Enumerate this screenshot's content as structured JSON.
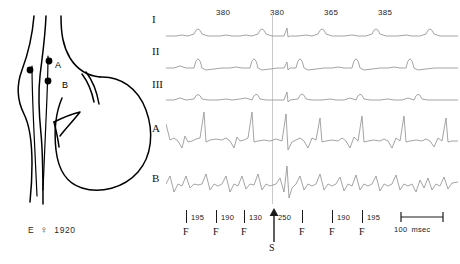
{
  "anatomy": {
    "caption_initial": "E",
    "caption_sex_symbol": "♀",
    "caption_year": "1920",
    "electrodes": [
      {
        "label": "A",
        "position": "upper"
      },
      {
        "label": "B",
        "position": "lower"
      }
    ],
    "line_color": "#000000"
  },
  "traces": {
    "channels": [
      {
        "label": "I",
        "kind": "surface-lead"
      },
      {
        "label": "II",
        "kind": "surface-lead"
      },
      {
        "label": "III",
        "kind": "surface-lead"
      },
      {
        "label": "A",
        "kind": "intracardiac"
      },
      {
        "label": "B",
        "kind": "intracardiac"
      }
    ],
    "top_intervals": [
      {
        "value": "380"
      },
      {
        "value": "380"
      },
      {
        "value": "365"
      },
      {
        "value": "385"
      }
    ],
    "trace_color": "#9a9a9a"
  },
  "ruler": {
    "markers": [
      {
        "caption": "F"
      },
      {
        "caption": "F"
      },
      {
        "caption": "F"
      },
      {
        "caption": "F"
      },
      {
        "caption": "F"
      },
      {
        "caption": "F"
      }
    ],
    "intervals": [
      {
        "value": "195"
      },
      {
        "value": "190"
      },
      {
        "value": "130"
      },
      {
        "value": "250"
      },
      {
        "value": "190"
      },
      {
        "value": "195"
      }
    ],
    "stimulus": {
      "caption": "S"
    },
    "scale": {
      "value": "100",
      "unit": "msec"
    }
  }
}
